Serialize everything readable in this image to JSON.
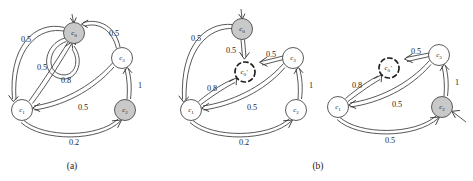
{
  "figure": {
    "width": 473,
    "height": 181,
    "background_color": "#ffffff",
    "stroke_color": "#3a3a3a",
    "node_fill_grey": "#c9c9c9",
    "node_fill_white": "#ffffff",
    "dashed_node_stroke": "#1f1f1f"
  },
  "captions": [
    {
      "id": "caption-a",
      "label": "(a)",
      "x": 72,
      "y": 166
    },
    {
      "id": "caption-b",
      "label": "(b)",
      "x": 318,
      "y": 166
    }
  ],
  "panels": [
    {
      "id": "panel-a",
      "caption": "(a)",
      "graphs": [
        {
          "id": "graph-a1",
          "nodes": [
            {
              "id": "a-c0",
              "label": "c",
              "sub": "0",
              "prime": "",
              "style": "grey",
              "cx": 74,
              "cy": 33,
              "r": 10.5
            },
            {
              "id": "a-c1",
              "label": "c",
              "sub": "1",
              "prime": "",
              "style": "white",
              "cx": 22,
              "cy": 110,
              "r": 10.5
            },
            {
              "id": "a-c2",
              "label": "c",
              "sub": "2",
              "prime": "",
              "style": "grey",
              "cx": 125,
              "cy": 110,
              "r": 10.5
            },
            {
              "id": "a-c3",
              "label": "c",
              "sub": "3",
              "prime": "",
              "style": "white",
              "cx": 122,
              "cy": 58,
              "r": 10.5
            }
          ],
          "edges": [
            {
              "id": "a-e-c0-c1",
              "from": "c0",
              "to": "c1",
              "weight": "0.5",
              "label_x": 26,
              "label_y": 39
            },
            {
              "id": "a-e-c0-self",
              "from": "c0",
              "to": "c0",
              "weight": "0.5",
              "label_x": 42,
              "label_y": 67
            },
            {
              "id": "a-e-c3-c0",
              "from": "c3",
              "to": "c0",
              "weight": "0.5",
              "label_x": 114,
              "label_y": 33
            },
            {
              "id": "a-e-c1-c0",
              "from": "c1",
              "to": "c0",
              "weight": "0.8",
              "label_x": 66,
              "label_y": 80
            },
            {
              "id": "a-e-c3-c1",
              "from": "c3",
              "to": "c1",
              "weight": "0.5",
              "label_x": 83,
              "label_y": 107
            },
            {
              "id": "a-e-c2-c3",
              "from": "c2",
              "to": "c3",
              "weight": "1",
              "label_x": 140,
              "label_y": 85
            },
            {
              "id": "a-e-c1-c2",
              "from": "c1",
              "to": "c2",
              "weight": "0.2",
              "label_x": 74,
              "label_y": 142
            }
          ]
        }
      ]
    },
    {
      "id": "panel-b",
      "caption": "(b)",
      "graphs": [
        {
          "id": "graph-b1",
          "nodes": [
            {
              "id": "b1-c0",
              "label": "c",
              "sub": "0",
              "prime": "",
              "style": "grey",
              "cx": 242,
              "cy": 29,
              "r": 10.5
            },
            {
              "id": "b1-c0p",
              "label": "c",
              "sub": "0",
              "prime": "′",
              "style": "dashed",
              "cx": 245,
              "cy": 72,
              "r": 10.0
            },
            {
              "id": "b1-c1",
              "label": "c",
              "sub": "1",
              "prime": "",
              "style": "white",
              "cx": 191,
              "cy": 110,
              "r": 10.5
            },
            {
              "id": "b1-c2",
              "label": "c",
              "sub": "2",
              "prime": "",
              "style": "white",
              "cx": 296,
              "cy": 110,
              "r": 10.5
            },
            {
              "id": "b1-c3",
              "label": "c",
              "sub": "3",
              "prime": "",
              "style": "white",
              "cx": 293,
              "cy": 58,
              "r": 10.5
            }
          ],
          "edges": [
            {
              "id": "b1-e-c0-c1",
              "from": "c0",
              "to": "c1",
              "weight": "0.5",
              "label_x": 196,
              "label_y": 38
            },
            {
              "id": "b1-e-c0-c0p",
              "from": "c0",
              "to": "c0p",
              "weight": "0.5",
              "label_x": 231,
              "label_y": 50
            },
            {
              "id": "b1-e-c3-c0p",
              "from": "c3",
              "to": "c0p",
              "weight": "0.5",
              "label_x": 271,
              "label_y": 54
            },
            {
              "id": "b1-e-c1-c0p",
              "from": "c1",
              "to": "c0p",
              "weight": "0.8",
              "label_x": 212,
              "label_y": 88
            },
            {
              "id": "b1-e-c3-c1",
              "from": "c3",
              "to": "c1",
              "weight": "0.5",
              "label_x": 252,
              "label_y": 107
            },
            {
              "id": "b1-e-c2-c3",
              "from": "c2",
              "to": "c3",
              "weight": "1",
              "label_x": 311,
              "label_y": 85
            },
            {
              "id": "b1-e-c1-c2",
              "from": "c1",
              "to": "c2",
              "weight": "0.2",
              "label_x": 244,
              "label_y": 142
            }
          ]
        },
        {
          "id": "graph-b2",
          "nodes": [
            {
              "id": "b2-c0p",
              "label": "c",
              "sub": "0",
              "prime": "′",
              "style": "dashed",
              "cx": 389,
              "cy": 68,
              "r": 10.0
            },
            {
              "id": "b2-c1",
              "label": "c",
              "sub": "1",
              "prime": "",
              "style": "white",
              "cx": 338,
              "cy": 107,
              "r": 10.5
            },
            {
              "id": "b2-c2",
              "label": "c",
              "sub": "2",
              "prime": "",
              "style": "grey",
              "cx": 442,
              "cy": 107,
              "r": 10.5
            },
            {
              "id": "b2-c3",
              "label": "c",
              "sub": "3",
              "prime": "",
              "style": "white",
              "cx": 439,
              "cy": 55,
              "r": 10.5
            }
          ],
          "edges": [
            {
              "id": "b2-e-c3-c0p",
              "from": "c3",
              "to": "c0p",
              "weight": "0.5",
              "label_x": 416,
              "label_y": 51
            },
            {
              "id": "b2-e-c1-c0p",
              "from": "c1",
              "to": "c0p",
              "weight": "0.8",
              "label_x": 357,
              "label_y": 85
            },
            {
              "id": "b2-e-c3-c1",
              "from": "c3",
              "to": "c1",
              "weight": "0.5",
              "label_x": 397,
              "label_y": 104
            },
            {
              "id": "b2-e-c2-c3",
              "from": "c2",
              "to": "c3",
              "weight": "1",
              "label_x": 457,
              "label_y": 82
            },
            {
              "id": "b2-e-c1-c2",
              "from": "c1",
              "to": "c2",
              "weight": "0.5",
              "label_x": 390,
              "label_y": 140
            }
          ]
        }
      ]
    }
  ]
}
